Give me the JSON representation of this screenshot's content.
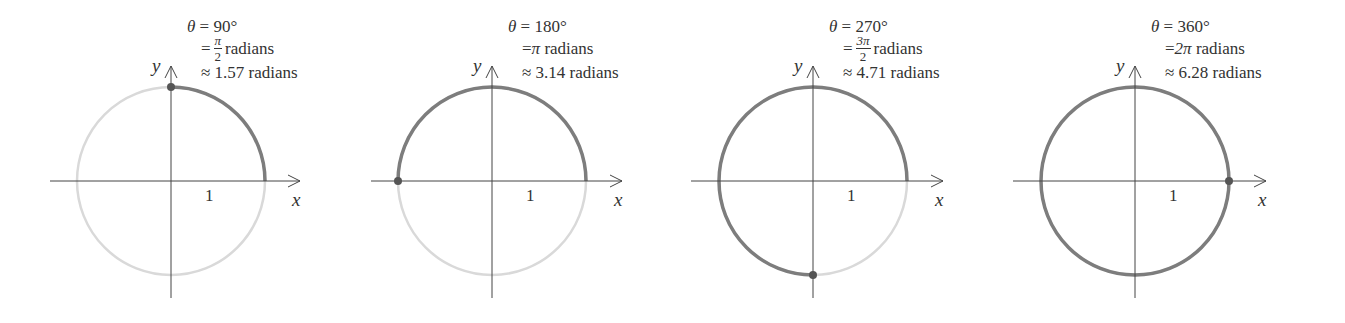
{
  "panels": [
    {
      "angle_deg": 90,
      "line1": "θ = 90°",
      "line2_prefix": "=",
      "line2_frac": {
        "num": "π",
        "den": "2"
      },
      "line2_text": "",
      "line2_suffix": "radians",
      "line3": "≈ 1.57 radians",
      "cx": 171,
      "cy": 181,
      "r": 94,
      "axis_x": [
        50,
        300
      ],
      "axis_y": [
        66,
        298
      ],
      "tick_label": "1",
      "x_label": "x",
      "y_label": "y"
    },
    {
      "angle_deg": 180,
      "line1": "θ = 180°",
      "line2_prefix": "=",
      "line2_frac": null,
      "line2_text": "π",
      "line2_suffix": "radians",
      "line3": "≈ 3.14 radians",
      "cx": 492,
      "cy": 181,
      "r": 94,
      "axis_x": [
        371,
        622
      ],
      "axis_y": [
        66,
        298
      ],
      "tick_label": "1",
      "x_label": "x",
      "y_label": "y"
    },
    {
      "angle_deg": 270,
      "line1": "θ = 270°",
      "line2_prefix": "=",
      "line2_frac": {
        "num": "3π",
        "den": "2"
      },
      "line2_text": "",
      "line2_suffix": "radians",
      "line3": "≈ 4.71 radians",
      "cx": 813,
      "cy": 181,
      "r": 94,
      "axis_x": [
        691,
        943
      ],
      "axis_y": [
        66,
        298
      ],
      "tick_label": "1",
      "x_label": "x",
      "y_label": "y"
    },
    {
      "angle_deg": 360,
      "line1": "θ = 360°",
      "line2_prefix": "=",
      "line2_frac": null,
      "line2_text": "2π",
      "line2_suffix": "radians",
      "line3": "≈ 6.28 radians",
      "cx": 1135,
      "cy": 181,
      "r": 94,
      "axis_x": [
        1013,
        1266
      ],
      "axis_y": [
        66,
        298
      ],
      "tick_label": "1",
      "x_label": "x",
      "y_label": "y"
    }
  ],
  "colors": {
    "arc": "#7d7d7d",
    "circle_faint": "#d9d9d9",
    "dot": "#555555",
    "axis": "#444444",
    "text": "#333333"
  }
}
